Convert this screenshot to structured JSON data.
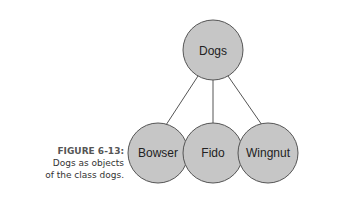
{
  "figure": {
    "number_label": "FIGURE 6-13:",
    "caption_line1": "Dogs as objects",
    "caption_line2": "of the class dogs."
  },
  "diagram": {
    "root": {
      "label": "Dogs"
    },
    "children": [
      {
        "label": "Bowser"
      },
      {
        "label": "Fido"
      },
      {
        "label": "Wingnut"
      }
    ],
    "colors": {
      "node_fill": "#c6c6c6",
      "node_stroke": "#555555",
      "edge": "#555555"
    }
  }
}
